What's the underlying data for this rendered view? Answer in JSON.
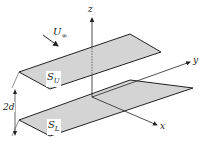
{
  "diagram": {
    "labels": {
      "z_axis": "z",
      "y_axis": "y",
      "x_axis": "x",
      "freestream": "U",
      "freestream_sub": "∞",
      "upper_plate": "S",
      "upper_plate_sub": "U",
      "lower_plate": "S",
      "lower_plate_sub": "L",
      "separation": "2d"
    },
    "colors": {
      "plate_fill": "#d4d4d4",
      "line": "#222222"
    }
  }
}
